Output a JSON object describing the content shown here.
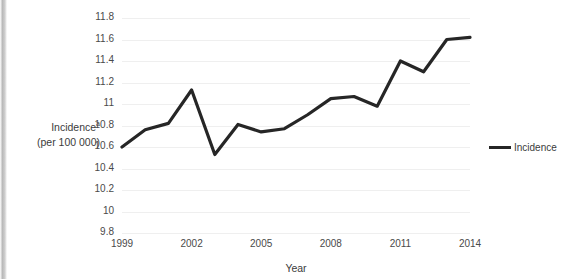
{
  "chart_data": {
    "type": "line",
    "title": "",
    "xlabel": "Year",
    "ylabel": "Incidenceᵃ (per 100 000)",
    "ylabel_line1": "Incidence",
    "ylabel_superscript": "a",
    "ylabel_line2": "(per 100 000)",
    "x": [
      1999,
      2000,
      2001,
      2002,
      2003,
      2004,
      2005,
      2006,
      2007,
      2008,
      2009,
      2010,
      2011,
      2012,
      2013,
      2014
    ],
    "xtick_labels": [
      "1999",
      "2002",
      "2005",
      "2008",
      "2011",
      "2014"
    ],
    "xtick_values": [
      1999,
      2002,
      2005,
      2008,
      2011,
      2014
    ],
    "ytick_labels": [
      "11.8",
      "11.6",
      "11.4",
      "11.2",
      "11",
      "10.8",
      "10.6",
      "10.4",
      "10.2",
      "10",
      "9.8"
    ],
    "ytick_values": [
      11.8,
      11.6,
      11.4,
      11.2,
      11.0,
      10.8,
      10.6,
      10.4,
      10.2,
      10.0,
      9.8
    ],
    "ylim": [
      9.8,
      11.8
    ],
    "xlim": [
      1999,
      2014
    ],
    "grid": true,
    "legend_position": "right",
    "line_color": "#262626",
    "grid_color": "#efefef",
    "series": [
      {
        "name": "Incidence",
        "values": [
          10.6,
          10.76,
          10.82,
          11.13,
          10.53,
          10.81,
          10.74,
          10.77,
          10.9,
          11.05,
          11.07,
          10.98,
          11.4,
          11.3,
          11.6,
          11.62
        ]
      }
    ]
  },
  "legend": {
    "entries": [
      {
        "label": "Incidence",
        "color": "#262626"
      }
    ]
  }
}
